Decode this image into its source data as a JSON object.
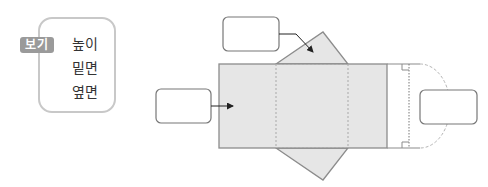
{
  "bogi": {
    "label": "보기",
    "items": [
      "높이",
      "밑면",
      "옆면"
    ]
  },
  "diagram": {
    "type": "triangular-prism-net",
    "answer_boxes": [
      {
        "id": "top",
        "value": "",
        "points_to": "base-triangle"
      },
      {
        "id": "left",
        "value": "",
        "points_to": "side-face"
      },
      {
        "id": "right",
        "value": "",
        "points_to": "height"
      }
    ],
    "colors": {
      "face_fill": "#e6e6e6",
      "edge": "#8c8c8c",
      "box_border": "#777777",
      "tag_bg": "#9a9a9a"
    }
  }
}
